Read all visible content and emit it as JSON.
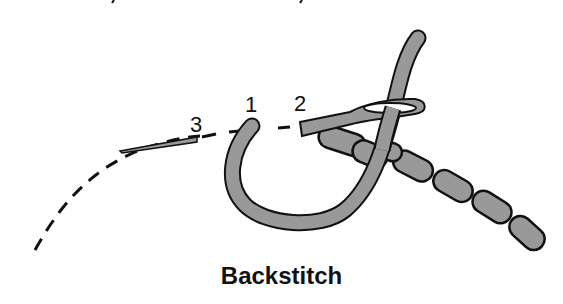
{
  "figure": {
    "caption": "Backstitch",
    "labels": [
      {
        "id": "3",
        "text": "3"
      },
      {
        "id": "1",
        "text": "1"
      },
      {
        "id": "2",
        "text": "2"
      }
    ],
    "colors": {
      "thread_fill": "#999999",
      "outline": "#111111",
      "background": "#ffffff"
    },
    "parts": [
      "dashed stitch path",
      "thread",
      "needle",
      "completed backstitches"
    ]
  }
}
